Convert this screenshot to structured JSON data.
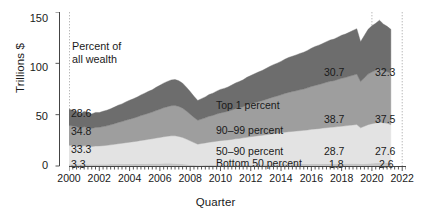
{
  "chart_data": {
    "type": "area",
    "stacked": true,
    "title": "",
    "xlabel": "Quarter",
    "ylabel": "Trillions $",
    "ylim": [
      0,
      150
    ],
    "yticks": [
      0,
      50,
      100,
      150
    ],
    "xlim": [
      2000,
      2022.25
    ],
    "xticks": [
      2000,
      2002,
      2004,
      2006,
      2008,
      2010,
      2012,
      2014,
      2016,
      2018,
      2020,
      2022
    ],
    "xtick_labels": [
      "2000",
      "2002",
      "2004",
      "2006",
      "2008",
      "2010",
      "2012",
      "2014",
      "2016",
      "2018",
      "2020",
      "2022"
    ],
    "minor_tick_interval_quarters": 1,
    "grid": "dotted vertical gridlines at 2000, 2020 and 2022",
    "legend": "inline band labels",
    "header_note": "Percent of\nall wealth",
    "header_note_line1": "Percent of",
    "header_note_line2": "all wealth",
    "annotation_columns": {
      "left_year": "2000",
      "mid_year": "2020",
      "right_year": "2022"
    },
    "series": [
      {
        "name": "Top 1 percent",
        "label": "Top 1 percent",
        "color": "#6d6d6d",
        "pct_start": "28.6",
        "pct_2020": "30.7",
        "pct_end": "32.3",
        "values": [
          15.8,
          15.4,
          15.0,
          14.2,
          15.0,
          14.6,
          14.0,
          14.6,
          14.4,
          14.9,
          15.2,
          15.6,
          16.2,
          16.8,
          17.2,
          17.9,
          18.4,
          18.9,
          19.4,
          20.1,
          20.7,
          21.3,
          21.8,
          22.6,
          23.3,
          24.0,
          24.6,
          25.1,
          25.3,
          25.0,
          24.4,
          23.3,
          22.0,
          20.6,
          19.3,
          19.9,
          20.4,
          21.2,
          21.6,
          22.3,
          22.9,
          23.2,
          23.6,
          24.4,
          25.1,
          25.6,
          26.2,
          27.1,
          27.6,
          28.3,
          28.9,
          29.4,
          30.1,
          30.9,
          31.5,
          32.0,
          32.6,
          33.4,
          34.0,
          34.4,
          34.9,
          35.4,
          35.8,
          36.5,
          37.2,
          37.9,
          38.4,
          38.9,
          39.6,
          40.2,
          40.5,
          41.2,
          41.9,
          42.3,
          42.9,
          43.6,
          44.2,
          38.9,
          41.3,
          43.6,
          44.9,
          45.8,
          46.9,
          45.3,
          44.1,
          43.0
        ]
      },
      {
        "name": "90-99 percent",
        "label": "90–99 percent",
        "color": "#9e9e9e",
        "pct_start": "34.8",
        "pct_2020": "38.7",
        "pct_end": "37.5",
        "values": [
          19.2,
          18.9,
          18.5,
          17.8,
          18.5,
          18.2,
          17.7,
          18.2,
          18.2,
          18.6,
          19.0,
          19.5,
          20.1,
          20.7,
          21.2,
          21.8,
          22.4,
          22.9,
          23.5,
          24.2,
          24.8,
          25.4,
          26.0,
          26.8,
          27.5,
          28.2,
          28.8,
          29.3,
          29.5,
          29.2,
          28.5,
          27.3,
          26.0,
          24.5,
          23.2,
          23.8,
          24.4,
          25.2,
          25.7,
          26.4,
          27.0,
          27.4,
          27.9,
          28.6,
          29.3,
          29.8,
          30.4,
          31.3,
          31.9,
          32.5,
          33.1,
          33.7,
          34.3,
          35.1,
          35.7,
          36.3,
          36.9,
          37.7,
          38.3,
          38.8,
          39.3,
          39.8,
          40.3,
          41.0,
          41.7,
          42.4,
          42.9,
          43.5,
          44.2,
          44.8,
          45.2,
          45.9,
          46.6,
          47.1,
          47.7,
          48.4,
          49.1,
          45.0,
          47.1,
          49.2,
          50.4,
          51.3,
          52.4,
          51.0,
          50.2,
          49.9
        ]
      },
      {
        "name": "50-90 percent",
        "label": "50–90 percent",
        "color": "#e3e3e3",
        "pct_start": "33.3",
        "pct_2020": "28.7",
        "pct_end": "27.6",
        "values": [
          18.4,
          18.2,
          17.9,
          17.3,
          17.9,
          17.6,
          17.2,
          17.6,
          17.7,
          18.0,
          18.3,
          18.7,
          19.2,
          19.7,
          20.1,
          20.6,
          21.1,
          21.5,
          22.0,
          22.6,
          23.1,
          23.6,
          24.1,
          24.7,
          25.3,
          25.9,
          26.4,
          26.8,
          26.9,
          26.5,
          25.8,
          24.6,
          23.3,
          21.9,
          20.6,
          21.1,
          21.6,
          22.2,
          22.6,
          23.1,
          23.6,
          23.9,
          24.2,
          24.7,
          25.2,
          25.6,
          26.0,
          26.6,
          27.1,
          27.5,
          27.9,
          28.3,
          28.8,
          29.3,
          29.7,
          30.1,
          30.5,
          31.0,
          31.4,
          31.7,
          32.0,
          32.3,
          32.6,
          33.0,
          33.5,
          33.9,
          34.2,
          34.6,
          35.0,
          35.4,
          35.6,
          36.0,
          36.4,
          36.7,
          37.1,
          37.5,
          37.9,
          35.0,
          36.4,
          37.8,
          38.5,
          39.0,
          39.6,
          38.8,
          38.3,
          36.7
        ]
      },
      {
        "name": "Bottom 50 percent",
        "label": "Bottom 50 percent",
        "color": "#c6c6c6",
        "pct_start": "3.3",
        "pct_2020": "1.8",
        "pct_end": "2.6",
        "values": [
          1.8,
          1.8,
          1.8,
          1.7,
          1.8,
          1.8,
          1.7,
          1.8,
          1.8,
          1.8,
          1.8,
          1.9,
          1.9,
          2.0,
          2.0,
          2.1,
          2.1,
          2.2,
          2.2,
          2.3,
          2.3,
          2.4,
          2.4,
          2.5,
          2.5,
          2.6,
          2.6,
          2.6,
          2.5,
          2.3,
          2.0,
          1.6,
          1.2,
          0.9,
          0.7,
          0.8,
          0.9,
          1.0,
          1.0,
          1.1,
          1.1,
          1.1,
          1.2,
          1.2,
          1.3,
          1.3,
          1.4,
          1.4,
          1.5,
          1.5,
          1.6,
          1.6,
          1.7,
          1.7,
          1.8,
          1.8,
          1.9,
          1.9,
          2.0,
          2.0,
          2.0,
          2.1,
          2.1,
          2.1,
          2.2,
          2.2,
          2.2,
          2.3,
          2.3,
          2.3,
          2.3,
          2.4,
          2.4,
          2.4,
          2.5,
          2.5,
          2.5,
          2.2,
          2.3,
          2.5,
          2.7,
          2.9,
          3.1,
          3.3,
          3.4,
          3.5
        ]
      }
    ]
  }
}
